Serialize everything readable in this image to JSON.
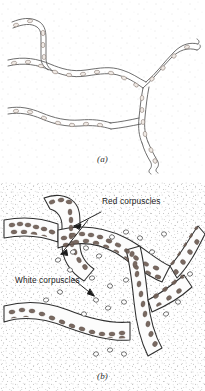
{
  "figure": {
    "kind": "scientific-illustration",
    "panels": [
      {
        "id": "a",
        "caption": "(a)",
        "description": "Capillary network with empty lumen and sparse endothelial nuclei",
        "labels": []
      },
      {
        "id": "b",
        "caption": "(b)",
        "description": "Capillary network engorged with blood corpuscles in stippled tissue",
        "labels": [
          {
            "id": "red",
            "text": "Red corpuscles",
            "x": 78,
            "y": 201
          },
          {
            "id": "white",
            "text": "White corpuscles",
            "x": 17,
            "y": 281
          }
        ]
      }
    ]
  },
  "colors": {
    "ink": "#1a1a1a",
    "vessel_outline": "#3b3b3b",
    "vessel_outline_light": "#6e6e6e",
    "red_corpuscle": "#6b5a52",
    "white_corpuscle_outline": "#5a5a5a",
    "stipple": "#8a8a8a",
    "background": "#ffffff",
    "lumen": "#fbfbfb"
  }
}
